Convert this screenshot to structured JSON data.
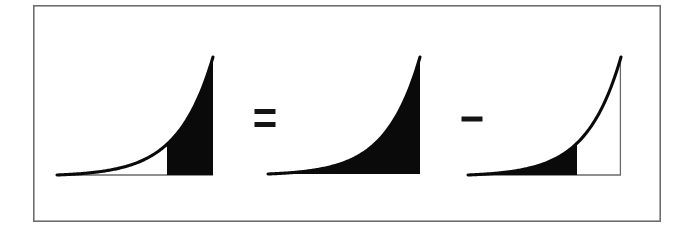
{
  "diagram": {
    "background_color": "#ffffff",
    "frame": {
      "name": "outer-border",
      "x": 33,
      "y": 5,
      "width": 628,
      "height": 217,
      "stroke_color": "#6e6e6e",
      "stroke_width": 1.6
    },
    "ink_color": "#0a0a0a",
    "axis_color": "#6a6a6a",
    "operators": [
      {
        "symbol": "=",
        "name": "equals-sign",
        "center_x": 265,
        "center_y": 118,
        "bar_width": 21,
        "bar_height": 5,
        "bar_gap": 8
      },
      {
        "symbol": "−",
        "name": "minus-sign",
        "center_x": 472,
        "center_y": 119,
        "bar_width": 21,
        "bar_height": 5,
        "bar_gap": 0
      }
    ],
    "panels": [
      {
        "name": "panel-partial-area",
        "label": "integral from a to b",
        "curve_type": "exponential",
        "x_left": 57,
        "x_right": 213,
        "baseline_y": 175,
        "peak_y": 57,
        "shade_start_x": 167,
        "shade_end_x": 213,
        "shaded": true,
        "curve_drawn_full": true,
        "axis_baseline_drawn": true,
        "right_edge_line": false
      },
      {
        "name": "panel-full-area",
        "label": "integral from 0 to b",
        "curve_type": "exponential",
        "x_left": 268,
        "x_right": 420,
        "baseline_y": 174,
        "peak_y": 57,
        "shade_start_x": 268,
        "shade_end_x": 420,
        "shaded": true,
        "curve_drawn_full": false,
        "axis_baseline_drawn": false,
        "right_edge_line": false
      },
      {
        "name": "panel-subtracted-area",
        "label": "integral from 0 to a",
        "curve_type": "exponential",
        "x_left": 468,
        "x_right": 621,
        "baseline_y": 175,
        "peak_y": 57,
        "shade_start_x": 468,
        "shade_end_x": 577,
        "shaded": true,
        "curve_drawn_full": true,
        "axis_baseline_drawn": true,
        "right_edge_line": true
      }
    ]
  },
  "chart_data": {
    "type": "area",
    "xlabel": "",
    "ylabel": "",
    "grid": false,
    "legend": null,
    "annotations": [
      "=",
      "−"
    ],
    "panels": [
      {
        "name": "integral a to b",
        "function": "exponential growth",
        "domain": [
          0,
          1
        ],
        "shaded_domain": [
          0.705,
          1.0
        ]
      },
      {
        "name": "integral 0 to b",
        "function": "exponential growth",
        "domain": [
          0,
          1
        ],
        "shaded_domain": [
          0.0,
          1.0
        ]
      },
      {
        "name": "integral 0 to a",
        "function": "exponential growth",
        "domain": [
          0,
          1
        ],
        "shaded_domain": [
          0.0,
          0.712
        ]
      }
    ]
  }
}
